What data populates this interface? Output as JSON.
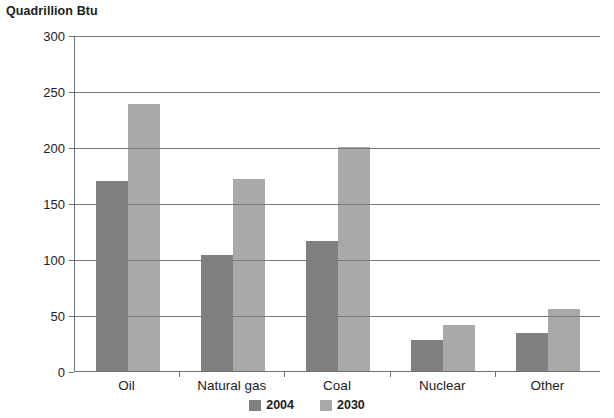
{
  "chart_data": {
    "type": "bar",
    "title": "Quadrillion Btu",
    "xlabel": "",
    "ylabel": "Quadrillion Btu",
    "categories": [
      "Oil",
      "Natural gas",
      "Coal",
      "Nuclear",
      "Other"
    ],
    "series": [
      {
        "name": "2004",
        "color": "#808080",
        "values": [
          170,
          104,
          116,
          28,
          34
        ]
      },
      {
        "name": "2030",
        "color": "#a9a9a9",
        "values": [
          238,
          171,
          200,
          41,
          55
        ]
      }
    ],
    "ylim": [
      0,
      300
    ],
    "yticks": [
      0,
      50,
      100,
      150,
      200,
      250,
      300
    ],
    "ytick_labels": [
      "0",
      "50",
      "100",
      "150",
      "200",
      "250",
      "300"
    ],
    "grid": "horizontal",
    "legend_position": "bottom-center"
  }
}
